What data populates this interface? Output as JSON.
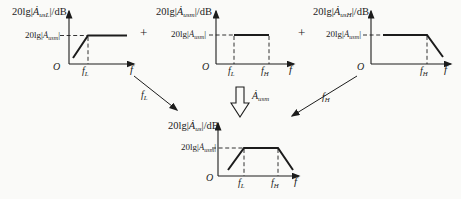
{
  "plots": [
    {
      "name": "low-frequency-plot",
      "ylabel": {
        "pre": "20lg|",
        "sym": "Ȧ",
        "sub": "usL",
        "post": "|/dB"
      },
      "level": {
        "pre": "20lg|",
        "sym": "Ȧ",
        "sub": "usm",
        "post": "|"
      },
      "origin": "O",
      "tick_fL": {
        "base": "f",
        "sub": "L"
      },
      "xlabel": "f"
    },
    {
      "name": "midband-plot",
      "ylabel": {
        "pre": "20lg|",
        "sym": "Ȧ",
        "sub": "usm",
        "post": "|/dB"
      },
      "level": {
        "pre": "20lg|",
        "sym": "Ȧ",
        "sub": "usm",
        "post": "|"
      },
      "origin": "O",
      "tick_fL": {
        "base": "f",
        "sub": "L"
      },
      "tick_fH": {
        "base": "f",
        "sub": "H"
      },
      "xlabel": "f"
    },
    {
      "name": "high-frequency-plot",
      "ylabel": {
        "pre": "20lg|",
        "sym": "Ȧ",
        "sub": "usH",
        "post": "|/dB"
      },
      "level": {
        "pre": "20lg|",
        "sym": "Ȧ",
        "sub": "usm",
        "post": "|"
      },
      "origin": "O",
      "tick_fH": {
        "base": "f",
        "sub": "H"
      },
      "xlabel": "f"
    },
    {
      "name": "combined-plot",
      "ylabel": {
        "pre": "20lg|",
        "sym": "Ȧ",
        "sub": "us",
        "post": "|/dB"
      },
      "level": {
        "pre": "20lg|",
        "sym": "Ȧ",
        "sub": "usm",
        "post": "|"
      },
      "origin": "O",
      "tick_fL": {
        "base": "f",
        "sub": "L"
      },
      "tick_fH": {
        "base": "f",
        "sub": "H"
      },
      "xlabel": "f"
    }
  ],
  "operators": {
    "plus_left": "+",
    "plus_right": "+"
  },
  "annotations": {
    "fl_arrow_label": {
      "base": "f",
      "sub": "L"
    },
    "fh_arrow_label": {
      "base": "f",
      "sub": "H"
    },
    "mid_arrow_label": {
      "sym": "Ȧ",
      "sub": "usm"
    }
  },
  "colors": {
    "line": "#1c1c1c",
    "background": "#fafaf8"
  }
}
